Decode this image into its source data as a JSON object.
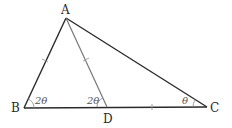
{
  "diagram": {
    "type": "triangle-geometry",
    "points": {
      "A": {
        "label": "A",
        "x": 66,
        "y": 18
      },
      "B": {
        "label": "B",
        "x": 24,
        "y": 108
      },
      "C": {
        "label": "C",
        "x": 207,
        "y": 107
      },
      "D": {
        "label": "D",
        "x": 107,
        "y": 107
      }
    },
    "angles": {
      "B": "2θ",
      "D": "2θ",
      "C": "θ"
    },
    "segments": [
      "AB",
      "AC",
      "BC",
      "AD"
    ],
    "equal_marks": [
      "AB",
      "AD",
      "DC"
    ],
    "colors": {
      "triangle_stroke": "#2a2a2a",
      "cevian_stroke": "#777777",
      "background": "#ffffff"
    }
  }
}
